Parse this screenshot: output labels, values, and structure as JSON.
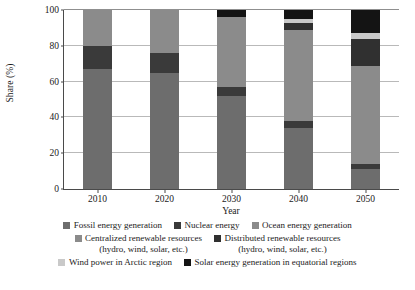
{
  "chart_data": {
    "type": "bar",
    "subtype": "stacked-bar-100",
    "title": "",
    "xlabel": "Year",
    "ylabel": "Share (%)",
    "categories": [
      "2010",
      "2020",
      "2030",
      "2040",
      "2050"
    ],
    "ylim": [
      0,
      100
    ],
    "yticks": [
      0,
      20,
      40,
      60,
      80,
      100
    ],
    "grid": true,
    "legend_position": "bottom",
    "series": [
      {
        "name": "Fossil energy generation",
        "color": "#6d6d6d",
        "values": [
          67,
          65,
          52,
          34,
          11
        ]
      },
      {
        "name": "Nuclear energy",
        "color": "#3a3a3a",
        "values": [
          13,
          11,
          5,
          4,
          3
        ]
      },
      {
        "name": "Ocean energy generation",
        "color": "#8b8b8b",
        "values": [
          20,
          0,
          0,
          0,
          0
        ]
      },
      {
        "name": "Centralized renewable resources",
        "name_sub": "(hydro, wind, solar, etc.)",
        "color": "#8b8b8b",
        "values": [
          0,
          24,
          39,
          51,
          55
        ]
      },
      {
        "name": "Distributed renewable resources",
        "name_sub": "(hydro, wind, solar, etc.)",
        "color": "#303030",
        "values": [
          0,
          0,
          0,
          4,
          15
        ]
      },
      {
        "name": "Wind power in Arctic region",
        "color": "#c9c9c9",
        "values": [
          0,
          0,
          0,
          2,
          3
        ]
      },
      {
        "name": "Solar energy generation in equatorial regions",
        "color": "#141414",
        "values": [
          0,
          0,
          4,
          5,
          13
        ]
      }
    ]
  },
  "axis": {
    "y_title": "Share (%)",
    "x_title": "Year",
    "ytick_labels": [
      "0",
      "20",
      "40",
      "60",
      "80",
      "100"
    ],
    "xtick_labels": [
      "2010",
      "2020",
      "2030",
      "2040",
      "2050"
    ]
  },
  "legend": {
    "row1": [
      {
        "label": "Fossil energy generation",
        "color": "#6d6d6d"
      },
      {
        "label": "Nuclear energy",
        "color": "#3a3a3a"
      },
      {
        "label": "Ocean energy generation",
        "color": "#8b8b8b"
      }
    ],
    "row2": [
      {
        "label": "Centralized renewable resources",
        "sub": "(hydro, wind, solar, etc.)",
        "color": "#8b8b8b"
      },
      {
        "label": "Distributed renewable resources",
        "sub": "(hydro, wind, solar, etc.)",
        "color": "#303030"
      }
    ],
    "row3": [
      {
        "label": "Wind power in Arctic region",
        "color": "#c9c9c9"
      },
      {
        "label": "Solar energy generation in equatorial regions",
        "color": "#141414"
      }
    ]
  }
}
